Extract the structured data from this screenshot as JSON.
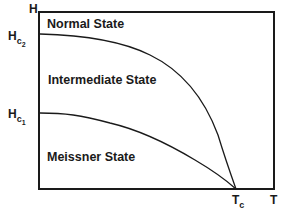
{
  "diagram": {
    "title": "",
    "y_axis": {
      "label": "H"
    },
    "x_axis": {
      "label": "T"
    },
    "y_ticks": [
      {
        "base": "H",
        "sub": "c",
        "subsub": "2"
      },
      {
        "base": "H",
        "sub": "c",
        "subsub": "1"
      }
    ],
    "x_ticks": [
      {
        "base": "T",
        "sub": "c"
      }
    ],
    "regions": {
      "normal": "Normal  State",
      "intermediate": "Intermediate  State",
      "meissner": "Meissner State"
    },
    "curves": [
      {
        "name": "Hc2(T)",
        "from": "Hc2",
        "to": "Tc"
      },
      {
        "name": "Hc1(T)",
        "from": "Hc1",
        "to": "Tc"
      }
    ],
    "colors": {
      "line": "#1a1a1a",
      "background": "#ffffff"
    }
  }
}
